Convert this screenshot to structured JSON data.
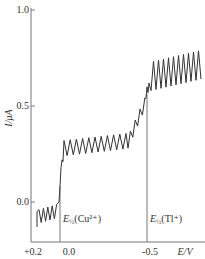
{
  "chart_data": {
    "type": "line",
    "title": "",
    "xlabel": "E/V",
    "ylabel": "I/μA",
    "x_ticks": [
      "+0.2",
      "0.0",
      "-0.5"
    ],
    "y_ticks": [
      "0.0",
      "0.5",
      "1.0"
    ],
    "xlim": [
      0.2,
      -0.75
    ],
    "ylim": [
      -0.2,
      1.0
    ],
    "grid": false,
    "legend": null,
    "annotations": [
      {
        "label_main": "E",
        "label_sub": "½",
        "label_rest": "(Cu²⁺)",
        "x": 0.05
      },
      {
        "label_main": "E",
        "label_sub": "½",
        "label_rest": "(Tl⁺)",
        "x": -0.48
      }
    ],
    "series": [
      {
        "name": "polarogram (oscillating, dropping mercury electrode)",
        "x": [
          0.17,
          0.05,
          0.02,
          -0.05,
          -0.2,
          -0.35,
          -0.42,
          -0.48,
          -0.52,
          -0.6,
          -0.75
        ],
        "y_mean": [
          -0.08,
          -0.05,
          0.25,
          0.27,
          0.28,
          0.3,
          0.38,
          0.55,
          0.63,
          0.65,
          0.67
        ],
        "oscillation_amplitude": 0.05,
        "description": "Two-wave polarogram: baseline ~-0.08 μA, Cu²⁺ wave rises near +0.05 V to plateau ~0.27 μA, Tl⁺ wave rises near -0.48 V to plateau ~0.65 μA"
      }
    ]
  },
  "axis": {
    "x_ticks": [
      {
        "label": "+0.2",
        "px": 33
      },
      {
        "label": "0.0",
        "px": 69
      },
      {
        "label": "-0.5",
        "px": 150
      }
    ],
    "y_ticks": [
      {
        "label": "1.0",
        "py": 10
      },
      {
        "label": "0.5",
        "py": 106
      },
      {
        "label": "0.0",
        "py": 202
      }
    ],
    "xlabel": "E/V",
    "ylabel": "I/μA"
  },
  "annotations": {
    "cu": {
      "main": "E",
      "sub": "½",
      "rest": "(Cu²⁺)"
    },
    "tl": {
      "main": "E",
      "sub": "½",
      "rest": "(Tl⁺)"
    }
  },
  "colors": {
    "axis": "#555555",
    "curve": "#333333",
    "text": "#333333"
  }
}
